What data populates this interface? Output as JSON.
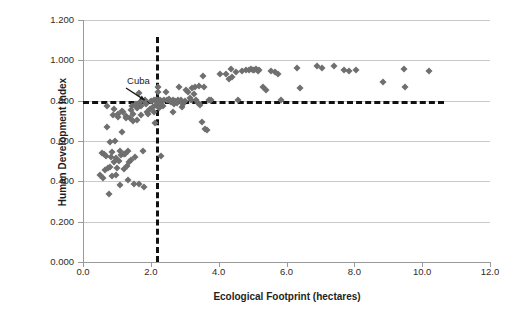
{
  "chart_data": {
    "type": "scatter",
    "title": "",
    "xlabel": "Ecological Footprint (hectares)",
    "ylabel": "Human Development Index",
    "xlim": [
      0.0,
      12.0
    ],
    "ylim": [
      0.0,
      1.2
    ],
    "xticks": [
      "0.0",
      "2.0",
      "4.0",
      "6.0",
      "8.0",
      "10.0",
      "12.0"
    ],
    "xtick_values": [
      0.0,
      2.0,
      4.0,
      6.0,
      8.0,
      10.0,
      12.0
    ],
    "yticks": [
      "0.000",
      "0.200",
      "0.400",
      "0.600",
      "0.800",
      "1.000",
      "1.200"
    ],
    "ytick_values": [
      0.0,
      0.2,
      0.4,
      0.6,
      0.8,
      1.0,
      1.2
    ],
    "grid": "horizontal",
    "legend": "none",
    "marker": "diamond",
    "marker_color": "#6f6f6f",
    "annotations": [
      {
        "label": "Cuba",
        "label_x": 1.3,
        "label_y": 0.9,
        "arrow_from_x": 1.28,
        "arrow_from_y": 0.865,
        "arrow_to_x": 1.83,
        "arrow_to_y": 0.805
      }
    ],
    "reference_lines": [
      {
        "name": "hdi-threshold",
        "orientation": "horizontal",
        "value": 0.8,
        "style": "dashed",
        "color": "#111111",
        "x_start": 0.0,
        "x_end": 10.65
      },
      {
        "name": "footprint-threshold",
        "orientation": "vertical",
        "value": 2.15,
        "style": "dashed",
        "color": "#111111",
        "y_start": 0.0,
        "y_end": 1.115
      }
    ],
    "points": [
      [
        0.5,
        0.432
      ],
      [
        0.55,
        0.54
      ],
      [
        0.58,
        0.418
      ],
      [
        0.62,
        0.535
      ],
      [
        0.65,
        0.457
      ],
      [
        0.68,
        0.525
      ],
      [
        0.7,
        0.773
      ],
      [
        0.72,
        0.672
      ],
      [
        0.74,
        0.464
      ],
      [
        0.76,
        0.336
      ],
      [
        0.78,
        0.472
      ],
      [
        0.8,
        0.594
      ],
      [
        0.82,
        0.519
      ],
      [
        0.84,
        0.425
      ],
      [
        0.86,
        0.545
      ],
      [
        0.88,
        0.73
      ],
      [
        0.9,
        0.757
      ],
      [
        0.92,
        0.495
      ],
      [
        0.94,
        0.6
      ],
      [
        0.96,
        0.43
      ],
      [
        0.98,
        0.518
      ],
      [
        1.0,
        0.466
      ],
      [
        1.02,
        0.718
      ],
      [
        1.04,
        0.736
      ],
      [
        1.06,
        0.503
      ],
      [
        1.08,
        0.552
      ],
      [
        1.1,
        0.384
      ],
      [
        1.12,
        0.529
      ],
      [
        1.14,
        0.645
      ],
      [
        1.16,
        0.75
      ],
      [
        1.18,
        0.742
      ],
      [
        1.2,
        0.463
      ],
      [
        1.22,
        0.538
      ],
      [
        1.24,
        0.534
      ],
      [
        1.26,
        0.716
      ],
      [
        1.28,
        0.725
      ],
      [
        1.3,
        0.476
      ],
      [
        1.32,
        0.553
      ],
      [
        1.34,
        0.408
      ],
      [
        1.36,
        0.497
      ],
      [
        1.38,
        0.713
      ],
      [
        1.4,
        0.752
      ],
      [
        1.42,
        0.508
      ],
      [
        1.44,
        0.774
      ],
      [
        1.46,
        0.7
      ],
      [
        1.48,
        0.735
      ],
      [
        1.5,
        0.387
      ],
      [
        1.52,
        0.52
      ],
      [
        1.55,
        0.782
      ],
      [
        1.58,
        0.763
      ],
      [
        1.6,
        0.704
      ],
      [
        1.62,
        0.769
      ],
      [
        1.64,
        0.385
      ],
      [
        1.66,
        0.838
      ],
      [
        1.68,
        0.792
      ],
      [
        1.7,
        0.728
      ],
      [
        1.72,
        0.773
      ],
      [
        1.76,
        0.553
      ],
      [
        1.8,
        0.37
      ],
      [
        1.82,
        0.806
      ],
      [
        1.85,
        0.782
      ],
      [
        1.88,
        0.742
      ],
      [
        1.92,
        0.735
      ],
      [
        1.96,
        0.759
      ],
      [
        2.0,
        0.798
      ],
      [
        2.05,
        0.768
      ],
      [
        2.08,
        0.804
      ],
      [
        2.1,
        0.745
      ],
      [
        2.12,
        0.69
      ],
      [
        2.15,
        0.803
      ],
      [
        2.16,
        0.78
      ],
      [
        2.18,
        0.805
      ],
      [
        2.2,
        0.87
      ],
      [
        2.22,
        0.845
      ],
      [
        2.24,
        0.762
      ],
      [
        2.26,
        0.806
      ],
      [
        2.28,
        0.791
      ],
      [
        2.3,
        0.526
      ],
      [
        2.32,
        0.799
      ],
      [
        2.36,
        0.772
      ],
      [
        2.4,
        0.802
      ],
      [
        2.44,
        0.843
      ],
      [
        2.48,
        0.805
      ],
      [
        2.52,
        0.81
      ],
      [
        2.56,
        0.8
      ],
      [
        2.6,
        0.793
      ],
      [
        2.64,
        0.804
      ],
      [
        2.66,
        0.745
      ],
      [
        2.68,
        0.783
      ],
      [
        2.72,
        0.8
      ],
      [
        2.76,
        0.788
      ],
      [
        2.8,
        0.805
      ],
      [
        2.84,
        0.87
      ],
      [
        2.88,
        0.805
      ],
      [
        2.92,
        0.771
      ],
      [
        2.96,
        0.783
      ],
      [
        3.0,
        0.8
      ],
      [
        3.05,
        0.855
      ],
      [
        3.1,
        0.845
      ],
      [
        3.14,
        0.815
      ],
      [
        3.18,
        0.802
      ],
      [
        3.22,
        0.863
      ],
      [
        3.26,
        0.835
      ],
      [
        3.3,
        0.868
      ],
      [
        3.34,
        0.806
      ],
      [
        3.38,
        0.789
      ],
      [
        3.42,
        0.872
      ],
      [
        3.46,
        0.78
      ],
      [
        3.5,
        0.693
      ],
      [
        3.54,
        0.921
      ],
      [
        3.58,
        0.87
      ],
      [
        3.6,
        0.659
      ],
      [
        3.66,
        0.655
      ],
      [
        3.72,
        0.805
      ],
      [
        3.78,
        0.806
      ],
      [
        4.05,
        0.93
      ],
      [
        4.2,
        0.934
      ],
      [
        4.3,
        0.908
      ],
      [
        4.35,
        0.957
      ],
      [
        4.4,
        0.918
      ],
      [
        4.5,
        0.944
      ],
      [
        4.58,
        0.804
      ],
      [
        4.7,
        0.949
      ],
      [
        4.8,
        0.953
      ],
      [
        4.88,
        0.952
      ],
      [
        4.95,
        0.955
      ],
      [
        5.0,
        0.95
      ],
      [
        5.05,
        0.953
      ],
      [
        5.1,
        0.955
      ],
      [
        5.15,
        0.947
      ],
      [
        5.2,
        0.951
      ],
      [
        5.3,
        0.87
      ],
      [
        5.4,
        0.855
      ],
      [
        5.55,
        0.948
      ],
      [
        5.65,
        0.94
      ],
      [
        5.75,
        0.933
      ],
      [
        5.85,
        0.804
      ],
      [
        6.3,
        0.963
      ],
      [
        6.4,
        0.863
      ],
      [
        6.9,
        0.97
      ],
      [
        7.05,
        0.962
      ],
      [
        7.4,
        0.971
      ],
      [
        7.7,
        0.953
      ],
      [
        7.85,
        0.948
      ],
      [
        8.05,
        0.952
      ],
      [
        8.85,
        0.893
      ],
      [
        9.45,
        0.956
      ],
      [
        9.5,
        0.87
      ],
      [
        10.2,
        0.948
      ]
    ]
  }
}
